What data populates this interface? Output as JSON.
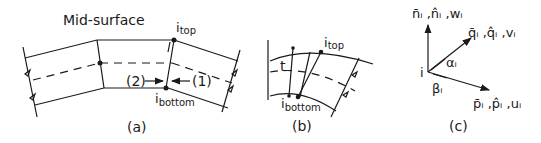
{
  "figure": {
    "panel_a": {
      "caption": "(a)",
      "title": "Mid-surface",
      "top_node": {
        "base": "i",
        "sub": "top"
      },
      "bottom_node": {
        "base": "i",
        "sub": "bottom"
      },
      "marker_2": "(2)",
      "marker_1": "(1)"
    },
    "panel_b": {
      "caption": "(b)",
      "thickness_label": "t",
      "top_node": {
        "base": "i",
        "sub": "top"
      },
      "bottom_node": {
        "base": "i",
        "sub": "bottom"
      }
    },
    "panel_c": {
      "caption": "(c)",
      "node_label": "i",
      "normal_axis": "n̄ᵢ ,n̂ᵢ ,wᵢ",
      "q_axis": "q̄ᵢ ,q̂ᵢ ,vᵢ",
      "p_axis": "p̄ᵢ ,p̂ᵢ ,uᵢ",
      "alpha": "αᵢ",
      "beta": "βᵢ"
    }
  }
}
